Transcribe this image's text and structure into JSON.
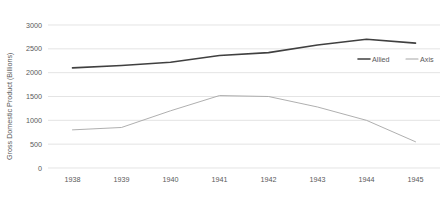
{
  "chart_data": {
    "type": "line",
    "title": "",
    "xlabel": "",
    "ylabel": "Gross Domestic Product (Billions)",
    "categories": [
      "1938",
      "1939",
      "1940",
      "1941",
      "1942",
      "1943",
      "1944",
      "1945"
    ],
    "x": [
      1938,
      1939,
      1940,
      1941,
      1942,
      1943,
      1944,
      1945
    ],
    "series": [
      {
        "name": "Allied",
        "color": "#404040",
        "values": [
          2100,
          2150,
          2220,
          2360,
          2420,
          2580,
          2700,
          2620
        ]
      },
      {
        "name": "Axis",
        "color": "#a6a6a6",
        "values": [
          800,
          850,
          1200,
          1520,
          1500,
          1280,
          1000,
          550
        ]
      }
    ],
    "ylim": [
      0,
      3000
    ],
    "y_ticks": [
      0,
      500,
      1000,
      1500,
      2000,
      2500,
      3000
    ],
    "y_tick_labels": [
      "0",
      "500",
      "1000",
      "1500",
      "2000",
      "2500",
      "3000"
    ],
    "grid": true,
    "legend_position": "right-inside-upper"
  },
  "legend": {
    "entries": [
      {
        "label": "Allied",
        "color": "#404040"
      },
      {
        "label": "Axis",
        "color": "#a6a6a6"
      }
    ]
  },
  "colors": {
    "allied": "#404040",
    "axis": "#a6a6a6",
    "gridline": "#d9d9d9",
    "text": "#595959",
    "background": "#ffffff"
  }
}
